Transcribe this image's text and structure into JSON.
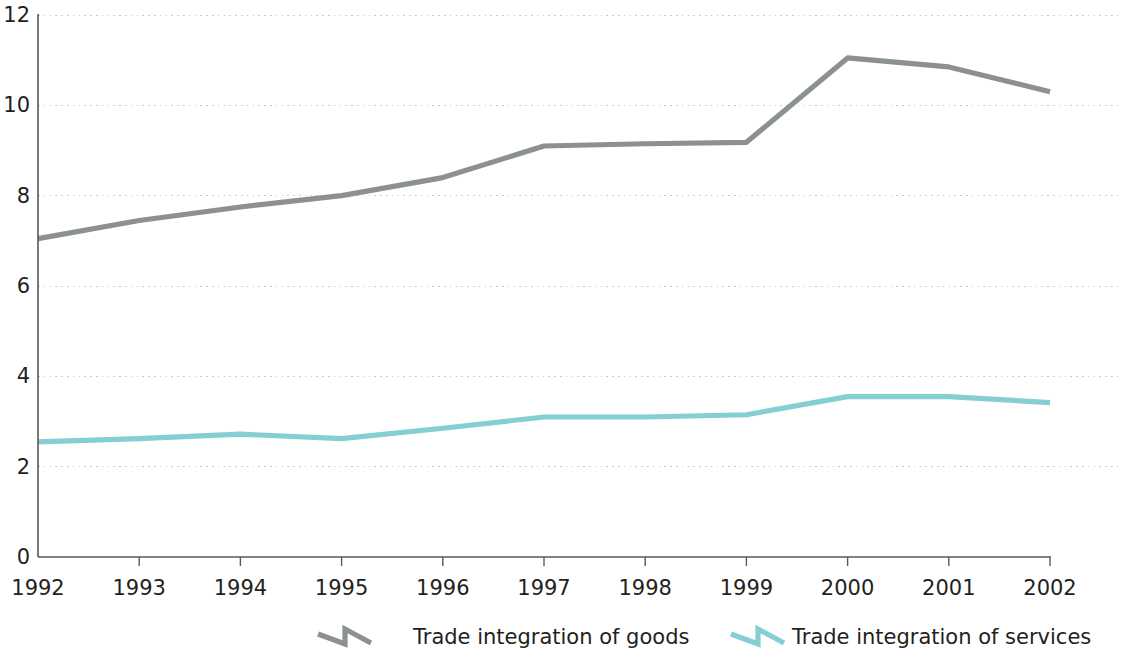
{
  "chart_data": {
    "type": "line",
    "title": "",
    "subtitle": "",
    "xlabel": "",
    "ylabel": "",
    "x": [
      1992,
      1993,
      1994,
      1995,
      1996,
      1997,
      1998,
      1999,
      2000,
      2001,
      2002
    ],
    "categories": [
      "1992",
      "1993",
      "1994",
      "1995",
      "1996",
      "1997",
      "1998",
      "1999",
      "2000",
      "2001",
      "2002"
    ],
    "series": [
      {
        "name": "Trade integration of goods",
        "color": "#8b9193",
        "values": [
          7.05,
          7.45,
          7.75,
          8.0,
          8.4,
          9.1,
          9.15,
          9.18,
          11.05,
          10.85,
          10.3
        ]
      },
      {
        "name": "Trade integration of services",
        "color": "#84ced4",
        "values": [
          2.55,
          2.62,
          2.72,
          2.62,
          2.85,
          3.1,
          3.1,
          3.15,
          3.55,
          3.55,
          3.42
        ]
      }
    ],
    "ylim": [
      0,
      12
    ],
    "yticks": [
      0,
      2,
      4,
      6,
      8,
      10,
      12
    ],
    "ytick_labels": [
      "0",
      "2",
      "4",
      "6",
      "8",
      "10",
      "12"
    ],
    "xtick_labels": [
      "1992",
      "1993",
      "1994",
      "1995",
      "1996",
      "1997",
      "1998",
      "1999",
      "2000",
      "2001",
      "2002"
    ],
    "grid": true,
    "grid_axis": "y",
    "legend_position": "bottom",
    "legend": [
      {
        "label": "Trade integration of goods",
        "color": "#8b9193"
      },
      {
        "label": "Trade integration of services",
        "color": "#84ced4"
      }
    ]
  },
  "axes": {
    "y_labels": [
      "12",
      "10",
      "8",
      "6",
      "4",
      "2",
      "0"
    ],
    "x_labels": [
      "1992",
      "1993",
      "1994",
      "1995",
      "1996",
      "1997",
      "1998",
      "1999",
      "2000",
      "2001",
      "2002"
    ]
  },
  "legend": {
    "entries": [
      {
        "label": "Trade integration of goods"
      },
      {
        "label": "Trade integration of services"
      }
    ]
  },
  "colors": {
    "goods_line": "#8b9193",
    "services_line": "#84ced4",
    "axis": "#58595b",
    "grid": "#c9c9c9",
    "text": "#231f20",
    "background": "#ffffff"
  }
}
